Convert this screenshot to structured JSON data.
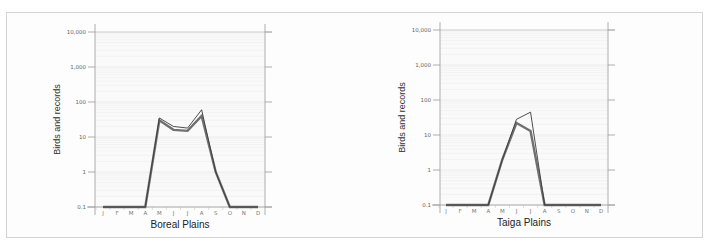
{
  "chart_data": [
    {
      "type": "line",
      "title": "Boreal Plains",
      "xlabel": "Boreal Plains",
      "ylabel": "Birds and records",
      "yscale": "log",
      "ylim": [
        0.1,
        10000
      ],
      "yticks": [
        "0.1",
        "1",
        "10",
        "100",
        "1,000",
        "10,000"
      ],
      "categories": [
        "J",
        "F",
        "M",
        "A",
        "M",
        "J",
        "J",
        "A",
        "S",
        "O",
        "N",
        "D"
      ],
      "grid": true,
      "series": [
        {
          "name": "birds (thin line)",
          "style": "thin",
          "color": "#3a3a3a",
          "values": [
            0.1,
            0.1,
            0.1,
            0.1,
            35,
            20,
            18,
            60,
            1,
            0.1,
            0.1,
            0.1
          ]
        },
        {
          "name": "records (thick line)",
          "style": "thick",
          "color": "#707070",
          "values": [
            0.1,
            0.1,
            0.1,
            0.1,
            30,
            16,
            15,
            40,
            1,
            0.1,
            0.1,
            0.1
          ]
        }
      ]
    },
    {
      "type": "line",
      "title": "Taiga Plains",
      "xlabel": "Taiga Plains",
      "ylabel": "Birds and records",
      "yscale": "log",
      "ylim": [
        0.1,
        10000
      ],
      "yticks": [
        "0.1",
        "1",
        "10",
        "100",
        "1,000",
        "10,000"
      ],
      "categories": [
        "J",
        "F",
        "M",
        "A",
        "M",
        "J",
        "J",
        "A",
        "S",
        "O",
        "N",
        "D"
      ],
      "grid": true,
      "series": [
        {
          "name": "birds (thin line)",
          "style": "thin",
          "color": "#3a3a3a",
          "values": [
            0.1,
            0.1,
            0.1,
            0.1,
            2,
            28,
            45,
            0.1,
            0.1,
            0.1,
            0.1,
            0.1
          ]
        },
        {
          "name": "records (thick line)",
          "style": "thick",
          "color": "#707070",
          "values": [
            0.1,
            0.1,
            0.1,
            0.1,
            2,
            22,
            13,
            0.1,
            0.1,
            0.1,
            0.1,
            0.1
          ]
        }
      ]
    }
  ],
  "panels": [
    {
      "x_label": "Boreal Plains",
      "y_label": "Birds and records"
    },
    {
      "x_label": "Taiga Plains",
      "y_label": "Birds and records"
    }
  ]
}
